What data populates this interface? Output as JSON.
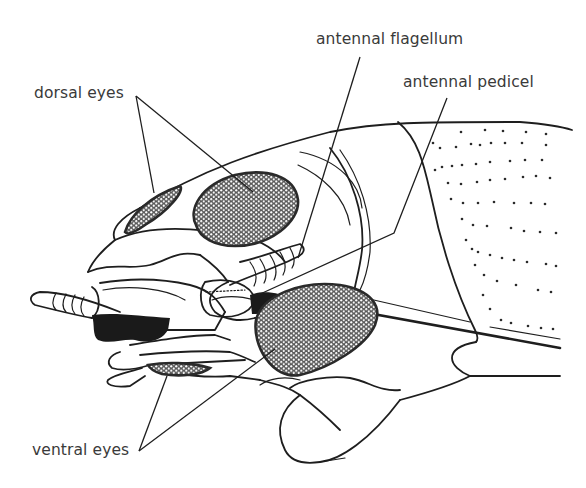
{
  "figure": {
    "style": "black line drawing on white",
    "colors": {
      "background": "#ffffff",
      "line": "#1e1e1e",
      "label_text": "#3a3a3a",
      "eye_fill": "#8c8c8c"
    }
  },
  "labels": {
    "dorsal_eyes": "dorsal eyes",
    "antennal_flagellum": "antennal flagellum",
    "antennal_pedicel": "antennal pedicel",
    "ventral_eyes": "ventral eyes"
  }
}
